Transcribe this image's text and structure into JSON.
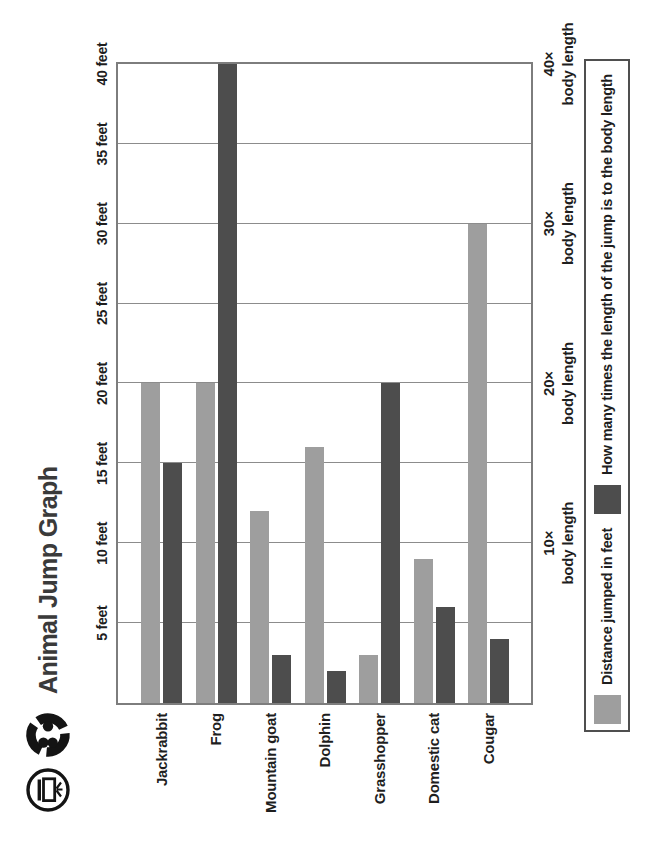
{
  "page": {
    "orientation_note": "landscape chart scanned rotated 90 degrees counter-clockwise",
    "icons": [
      {
        "name": "door-arrow-icon"
      },
      {
        "name": "group-swirl-icon"
      }
    ]
  },
  "chart_data": {
    "type": "bar",
    "title": "Animal Jump Graph",
    "orientation": "horizontal bars (page rotated -90deg)",
    "categories": [
      "Jackrabbit",
      "Frog",
      "Mountain goat",
      "Dolphin",
      "Grasshopper",
      "Domestic cat",
      "Cougar"
    ],
    "series": [
      {
        "name": "Distance jumped in feet",
        "color": "#9e9e9e",
        "unit": "feet",
        "values": [
          20,
          20,
          12,
          16,
          3,
          9,
          30
        ]
      },
      {
        "name": "How many times the length of the jump is to the body length",
        "color": "#4d4d4d",
        "unit": "x body length",
        "values": [
          15,
          40,
          3,
          2,
          20,
          6,
          4
        ]
      }
    ],
    "value_axis": {
      "min": 0,
      "max": 40,
      "tick_interval": 5,
      "grid": true,
      "ticks": [
        "5 feet",
        "10 feet",
        "15 feet",
        "20 feet",
        "25 feet",
        "30 feet",
        "35 feet",
        "40 feet"
      ]
    },
    "secondary_axis": {
      "labels": [
        {
          "line1": "10×",
          "line2": "body length",
          "at": 10
        },
        {
          "line1": "20×",
          "line2": "body length",
          "at": 20
        },
        {
          "line1": "30×",
          "line2": "body length",
          "at": 30
        },
        {
          "line1": "40×",
          "line2": "body length",
          "at": 40
        }
      ]
    },
    "legend": {
      "position": "bottom",
      "items": [
        {
          "label": "Distance jumped in feet",
          "color": "#9e9e9e"
        },
        {
          "label": "How many times the length of the jump is to the body length",
          "color": "#4d4d4d"
        }
      ]
    },
    "colors": {
      "light_bar": "#9e9e9e",
      "dark_bar": "#4d4d4d",
      "gridline": "#8c8c8c",
      "plot_border": "#7d7d7d",
      "legend_border": "#4f4f4f",
      "text": "#1e1e1e",
      "title": "#3a3a3a"
    }
  }
}
